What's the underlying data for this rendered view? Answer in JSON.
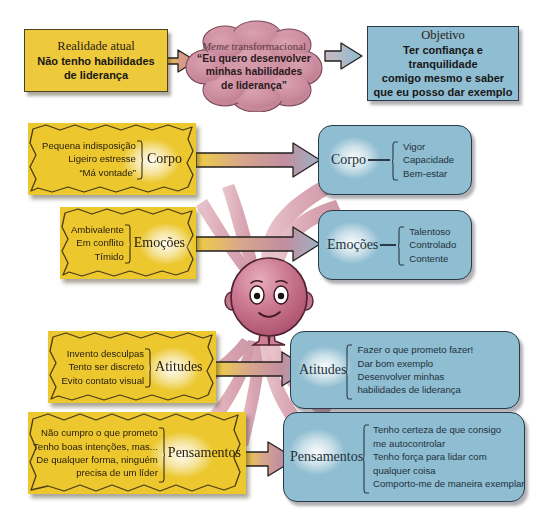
{
  "diagram": {
    "colors": {
      "yellow": "#ecc72e",
      "yellow_header": "#eec93b",
      "blue": "#8fbdd1",
      "cloud_pink": "#cb8b9e",
      "ray_pink": "#d9a6b2",
      "figure_rose": "#c4637f",
      "outline": "#2a3a46"
    }
  },
  "header": {
    "reality": {
      "title": "Realidade atual",
      "lines": [
        "Não tenho habilidades",
        "de liderança"
      ]
    },
    "meme": {
      "label_italic": "Meme",
      "label_rest": " transformacional",
      "lines": [
        "“Eu quero desenvolver",
        "minhas habilidades",
        "de liderança”"
      ]
    },
    "objective": {
      "title": "Objetivo",
      "lines": [
        "Ter confiança e tranquilidade",
        "comigo mesmo e saber",
        "que eu posso dar exemplo"
      ]
    }
  },
  "rows": [
    {
      "key": "corpo",
      "label_left": "Corpo",
      "label_right": "Corpo",
      "left_items": [
        "Pequena indisposição",
        "Ligeiro estresse",
        "“Má vontade”"
      ],
      "right_items": [
        "Vigor",
        "Capacidade",
        "Bem-estar"
      ]
    },
    {
      "key": "emocoes",
      "label_left": "Emoções",
      "label_right": "Emoções",
      "left_items": [
        "Ambivalente",
        "Em conflito",
        "Tímido"
      ],
      "right_items": [
        "Talentoso",
        "Controlado",
        "Contente"
      ]
    },
    {
      "key": "atitudes",
      "label_left": "Atitudes",
      "label_right": "Atitudes",
      "left_items": [
        "Invento desculpas",
        "Tento ser discreto",
        "Evito contato visual"
      ],
      "right_items": [
        "Fazer o que prometo fazer!",
        "Dar bom exemplo",
        "Desenvolver minhas",
        "habilidades de liderança"
      ]
    },
    {
      "key": "pensamentos",
      "label_left": "Pensamentos",
      "label_right": "Pensamentos",
      "left_items": [
        "Não cumpro o que prometo",
        "Tenho boas intenções, mas...",
        "De qualquer forma, ninguém",
        "precisa de um líder"
      ],
      "right_items": [
        "Tenho certeza de que consigo",
        "me autocontrolar",
        "Tenho força para lidar com",
        "qualquer coisa",
        "Comporto-me de maneira exemplar"
      ]
    }
  ],
  "figure": {
    "name": "personagem-central"
  }
}
